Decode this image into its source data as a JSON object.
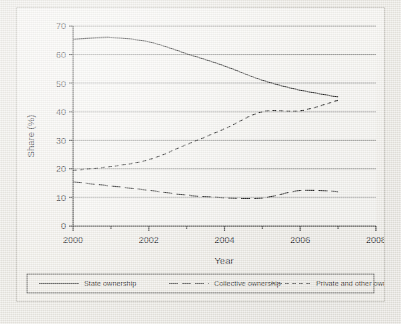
{
  "chart_data": {
    "type": "line",
    "title": "",
    "xlabel": "Year",
    "ylabel": "Share (%)",
    "xlim": [
      2000,
      2008
    ],
    "ylim": [
      0,
      70
    ],
    "ytick_labels": [
      "0",
      "10",
      "20",
      "30",
      "40",
      "50",
      "60",
      "70"
    ],
    "ytick_values": [
      0,
      10,
      20,
      30,
      40,
      50,
      60,
      70
    ],
    "xtick_labels": [
      "2000",
      "2002",
      "2004",
      "2006",
      "2008"
    ],
    "xtick_values": [
      2000,
      2002,
      2004,
      2006,
      2008
    ],
    "xminor_ticks": [
      2001,
      2003,
      2005,
      2007
    ],
    "grid": "horizontal",
    "legend_position": "bottom",
    "x": [
      2000,
      2001,
      2002,
      2003,
      2004,
      2005,
      2006,
      2007
    ],
    "series": [
      {
        "name": "State ownership",
        "style": "solid",
        "values": [
          65.3,
          66.0,
          64.5,
          60.3,
          56.0,
          51.0,
          47.5,
          45.2
        ]
      },
      {
        "name": "Collective ownership",
        "style": "long-dash",
        "values": [
          15.5,
          14.0,
          12.5,
          10.8,
          9.9,
          9.8,
          12.4,
          12.0
        ]
      },
      {
        "name": "Private and other ownerships",
        "style": "short-dash",
        "values": [
          19.5,
          20.8,
          23.2,
          28.5,
          34.0,
          40.0,
          40.3,
          44.0
        ]
      }
    ]
  },
  "legend": {
    "items": [
      {
        "label": "State ownership",
        "dash": "none"
      },
      {
        "label": "Collective ownership",
        "dash": "9,4"
      },
      {
        "label": "Private and other ownerships",
        "dash": "4,3"
      }
    ]
  },
  "axes": {
    "x_title": "Year",
    "y_title": "Share (%)"
  },
  "colors": {
    "line": "#1c1c1b",
    "grid": "#8d8d8a",
    "axis": "#1c1c1b",
    "frame": "#b9b6ae",
    "paper": "#e9e7e1",
    "plot_bg": "#f3f1ed"
  }
}
